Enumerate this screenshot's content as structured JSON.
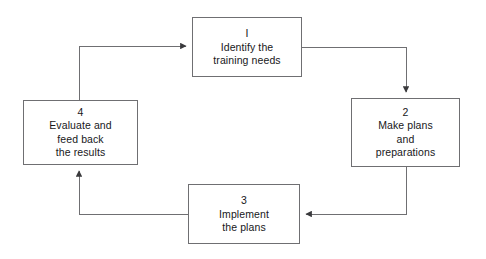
{
  "diagram": {
    "type": "cycle-flowchart",
    "background_color": "#ffffff",
    "line_color": "#6f6f72",
    "text_color": "#17171a",
    "nodes": [
      {
        "id": "node-1",
        "number": "I",
        "label": "Identify the\ntraining needs"
      },
      {
        "id": "node-2",
        "number": "2",
        "label": "Make plans\nand\npreparations"
      },
      {
        "id": "node-3",
        "number": "3",
        "label": "Implement\nthe plans"
      },
      {
        "id": "node-4",
        "number": "4",
        "label": "Evaluate and\nfeed back\nthe results"
      }
    ],
    "connectors": [
      {
        "id": "edge-1-to-2",
        "from": "node-1",
        "to": "node-2",
        "direction": "right-then-down"
      },
      {
        "id": "edge-2-to-3",
        "from": "node-2",
        "to": "node-3",
        "direction": "down-then-left"
      },
      {
        "id": "edge-3-to-4",
        "from": "node-3",
        "to": "node-4",
        "direction": "left-then-up"
      },
      {
        "id": "edge-4-to-1",
        "from": "node-4",
        "to": "node-1",
        "direction": "up-then-right"
      }
    ]
  }
}
